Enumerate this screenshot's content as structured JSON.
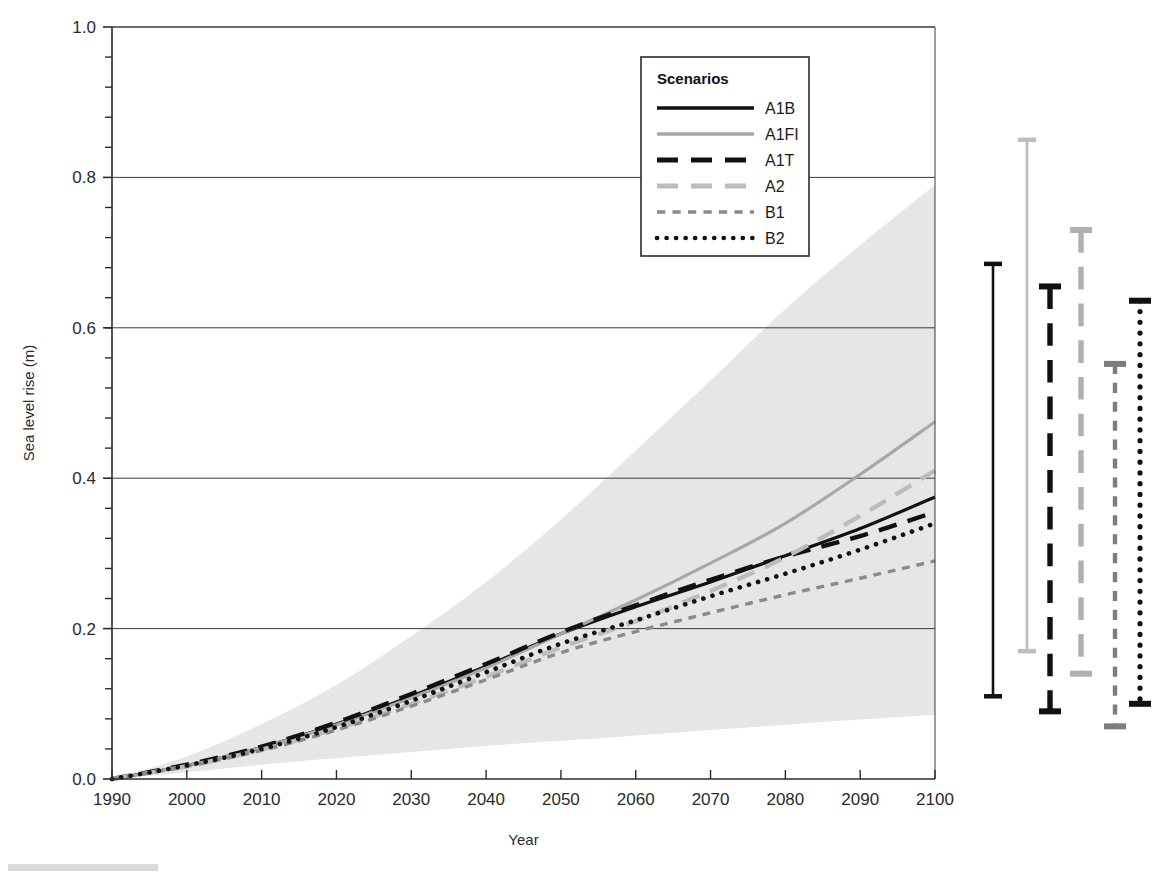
{
  "figure": {
    "title": "",
    "axis": {
      "xlabel": "Year",
      "ylabel": "Sea level rise (m)",
      "xticks": [
        "1990",
        "2000",
        "2010",
        "2020",
        "2030",
        "2040",
        "2050",
        "2060",
        "2070",
        "2080",
        "2090",
        "2100"
      ],
      "yticks": [
        "0.0",
        "0.2",
        "0.4",
        "0.6",
        "0.8",
        "1.0"
      ]
    },
    "legend": {
      "title": "Scenarios",
      "entries": [
        {
          "label": "A1B",
          "style": "solid",
          "color": "#111111"
        },
        {
          "label": "A1FI",
          "style": "solid",
          "color": "#a8a8a8"
        },
        {
          "label": "A1T",
          "style": "dashed",
          "color": "#111111"
        },
        {
          "label": "A2",
          "style": "dashed",
          "color": "#bcbcbc"
        },
        {
          "label": "B1",
          "style": "shortdash",
          "color": "#8a8a8a"
        },
        {
          "label": "B2",
          "style": "dotted",
          "color": "#111111"
        }
      ]
    }
  },
  "chart_data": {
    "type": "line",
    "title": "",
    "xlabel": "Year",
    "ylabel": "Sea level rise (m)",
    "xlim": [
      1990,
      2100
    ],
    "ylim": [
      0.0,
      1.0
    ],
    "xticks": [
      1990,
      2000,
      2010,
      2020,
      2030,
      2040,
      2050,
      2060,
      2070,
      2080,
      2090,
      2100
    ],
    "yticks": [
      0.0,
      0.2,
      0.4,
      0.6,
      0.8,
      1.0
    ],
    "yminor_step": 0.04,
    "grid": "horizontal-major",
    "legend": {
      "position": "top-center-inside",
      "title": "Scenarios"
    },
    "x": [
      1990,
      2000,
      2010,
      2020,
      2030,
      2040,
      2050,
      2060,
      2070,
      2080,
      2090,
      2100
    ],
    "series": [
      {
        "name": "A1B",
        "style": "solid",
        "color": "#111111",
        "values": [
          0.0,
          0.018,
          0.042,
          0.073,
          0.11,
          0.15,
          0.193,
          0.229,
          0.262,
          0.297,
          0.333,
          0.375
        ]
      },
      {
        "name": "A1FI",
        "style": "solid",
        "color": "#a8a8a8",
        "values": [
          0.0,
          0.018,
          0.042,
          0.072,
          0.108,
          0.148,
          0.193,
          0.238,
          0.287,
          0.34,
          0.405,
          0.475
        ]
      },
      {
        "name": "A1T",
        "style": "dashed",
        "color": "#111111",
        "values": [
          0.0,
          0.019,
          0.043,
          0.075,
          0.113,
          0.153,
          0.195,
          0.231,
          0.265,
          0.296,
          0.323,
          0.355
        ]
      },
      {
        "name": "A2",
        "style": "dashed",
        "color": "#bcbcbc",
        "values": [
          0.0,
          0.017,
          0.039,
          0.067,
          0.1,
          0.136,
          0.175,
          0.21,
          0.25,
          0.295,
          0.35,
          0.41
        ]
      },
      {
        "name": "B1",
        "style": "shortdash",
        "color": "#8a8a8a",
        "values": [
          0.0,
          0.017,
          0.038,
          0.065,
          0.097,
          0.132,
          0.168,
          0.196,
          0.221,
          0.245,
          0.267,
          0.29
        ]
      },
      {
        "name": "B2",
        "style": "dotted",
        "color": "#111111",
        "values": [
          0.0,
          0.018,
          0.04,
          0.069,
          0.104,
          0.142,
          0.18,
          0.211,
          0.243,
          0.273,
          0.305,
          0.34
        ]
      }
    ],
    "envelope": {
      "name": "full range of model uncertainty",
      "fill": "#e6e6e6",
      "x": [
        1990,
        2000,
        2010,
        2020,
        2030,
        2040,
        2050,
        2060,
        2070,
        2080,
        2090,
        2100
      ],
      "upper": [
        0.0,
        0.03,
        0.073,
        0.125,
        0.19,
        0.262,
        0.345,
        0.437,
        0.53,
        0.625,
        0.71,
        0.79
      ],
      "lower": [
        0.0,
        0.009,
        0.019,
        0.028,
        0.036,
        0.044,
        0.051,
        0.058,
        0.065,
        0.072,
        0.079,
        0.085
      ]
    },
    "error_bars": {
      "note": "2090-2099 ranges including land-ice uncertainty, plotted to the right of the axis",
      "unit": "m",
      "bars": [
        {
          "name": "A1B",
          "style": "solid",
          "color": "#111111",
          "low": 0.11,
          "high": 0.685
        },
        {
          "name": "A1FI",
          "style": "solid",
          "color": "#bdbdbd",
          "low": 0.17,
          "high": 0.85
        },
        {
          "name": "A1T",
          "style": "dashed",
          "color": "#111111",
          "low": 0.09,
          "high": 0.655
        },
        {
          "name": "A2",
          "style": "dashed",
          "color": "#b0b0b0",
          "low": 0.14,
          "high": 0.73
        },
        {
          "name": "B1",
          "style": "shortdash",
          "color": "#7d7d7d",
          "low": 0.07,
          "high": 0.552
        },
        {
          "name": "B2",
          "style": "dotted",
          "color": "#111111",
          "low": 0.1,
          "high": 0.636
        }
      ]
    }
  }
}
